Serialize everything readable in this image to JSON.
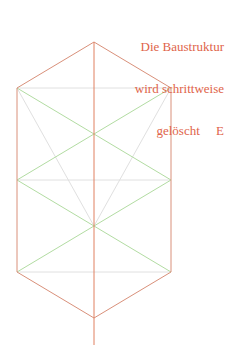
{
  "caption": {
    "line1": "Die Baustruktur",
    "line2": "wird schrittweise",
    "line3": "gelöscht     E"
  },
  "colors": {
    "outline": "#d9826a",
    "green": "#a8d898",
    "gray": "#dcdcdc",
    "text": "#e0644a"
  }
}
